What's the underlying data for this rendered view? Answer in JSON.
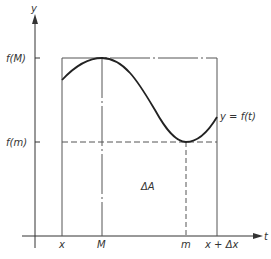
{
  "diagram": {
    "axes": {
      "y_label": "y",
      "t_label": "t"
    },
    "y_ticks": {
      "fM": "f(M)",
      "fm": "f(m)"
    },
    "t_ticks": {
      "x": "x",
      "M": "M",
      "m": "m",
      "x_plus_dx": "x + Δx"
    },
    "curve_label": "y = f(t)",
    "area_label": "ΔA",
    "colors": {
      "line": "#333333",
      "curve": "#222222",
      "background": "#ffffff"
    }
  }
}
